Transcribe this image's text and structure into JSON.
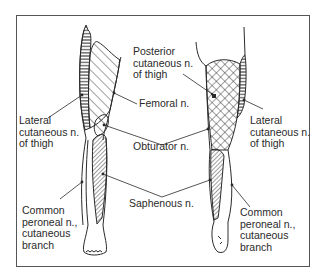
{
  "figure": {
    "colors": {
      "line": "#2a2a2a",
      "frame": "#555555",
      "background": "#ffffff"
    }
  },
  "labels": {
    "posterior_cutaneous": "Posterior\ncutaneous n.\nof thigh",
    "femoral": "Femoral n.",
    "lateral_cutaneous_left": "Lateral\ncutaneous n.\nof thigh",
    "lateral_cutaneous_right": "Lateral\ncutaneous n.\nof thigh",
    "obturator": "Obturator n.",
    "saphenous": "Saphenous n.",
    "common_peroneal_left": "Common\nperoneal n.,\ncutaneous\nbranch",
    "common_peroneal_right": "Common\nperoneal n.,\ncutaneous\nbranch"
  },
  "legend": {
    "horizontal_lines": "Lateral cutaneous n. of thigh",
    "diagonal_lines": "Femoral n.",
    "crosshatch": "Posterior cutaneous n. of thigh",
    "dense_diagonal": "Saphenous n.",
    "unshaded": "Common peroneal n., cutaneous branch"
  }
}
